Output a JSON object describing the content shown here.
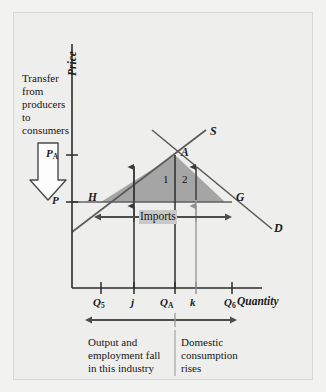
{
  "figure": {
    "type": "supply-demand-diagram",
    "background_color": "#eeeeec",
    "shade_color": "#a8a8a8",
    "line_color": "#4a4a4a"
  },
  "axes": {
    "y_title": "Price",
    "x_title": "Quantity",
    "y_ticks": [
      {
        "key": "PA",
        "label": "P",
        "sub": "A"
      },
      {
        "key": "P",
        "label": "P",
        "sub": ""
      }
    ],
    "x_ticks": [
      {
        "key": "Q5",
        "label": "Q",
        "sub": "5"
      },
      {
        "key": "j",
        "label": "j",
        "sub": ""
      },
      {
        "key": "QA",
        "label": "Q",
        "sub": "A"
      },
      {
        "key": "k",
        "label": "k",
        "sub": ""
      },
      {
        "key": "Q6",
        "label": "Q",
        "sub": "6"
      }
    ]
  },
  "curves": [
    {
      "name": "supply",
      "label": "S"
    },
    {
      "name": "demand",
      "label": "D"
    }
  ],
  "points": [
    {
      "name": "equilibrium",
      "label": "A"
    },
    {
      "name": "left-corner",
      "label": "H"
    },
    {
      "name": "right-corner",
      "label": "G"
    }
  ],
  "regions": [
    {
      "name": "region-one",
      "label": "1"
    },
    {
      "name": "region-two",
      "label": "2"
    }
  ],
  "annotations": {
    "transfer_note": "Transfer\nfrom\nproducers\nto\nconsumers",
    "imports_label": "Imports",
    "bottom_left_note": "Output and\nemployment fall\nin this industry",
    "bottom_right_note": "Domestic\nconsumption\nrises"
  }
}
